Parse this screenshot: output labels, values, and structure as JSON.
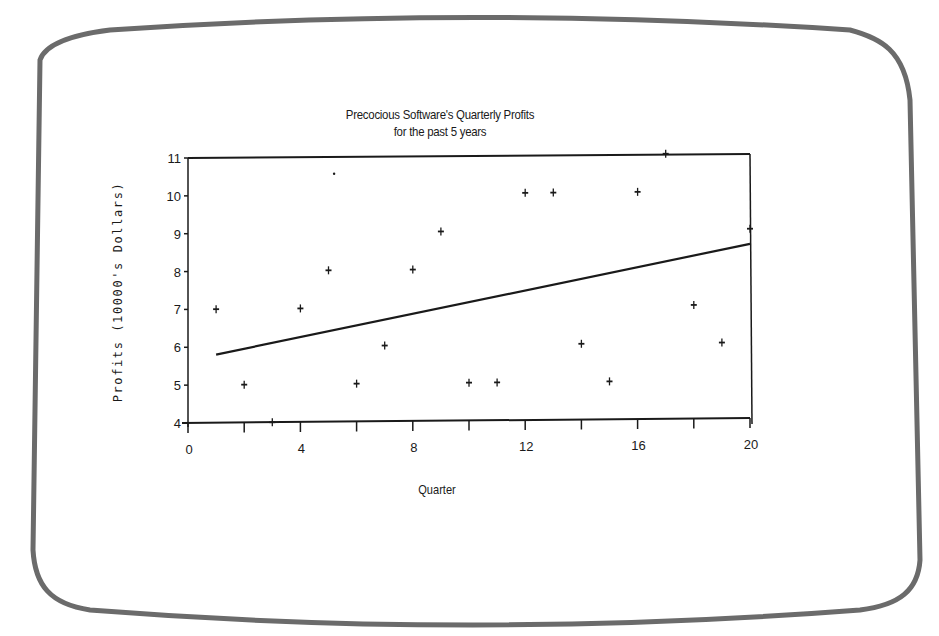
{
  "chart_data": {
    "type": "scatter",
    "title": "Precocious Software's Quarterly Profits",
    "subtitle": "for the past 5 years",
    "xlabel": "Quarter",
    "ylabel": "Profits (10000's Dollars)",
    "xlim": [
      0,
      20
    ],
    "ylim": [
      4,
      11
    ],
    "x_ticks": [
      0,
      2,
      4,
      6,
      8,
      10,
      12,
      14,
      16,
      18,
      20
    ],
    "x_tick_labels": [
      "0",
      "4",
      "8",
      "12",
      "16",
      "20"
    ],
    "x_tick_label_values": [
      0,
      4,
      8,
      12,
      16,
      20
    ],
    "y_ticks": [
      4,
      5,
      6,
      7,
      8,
      9,
      10,
      11
    ],
    "y_tick_labels": [
      "4",
      "5",
      "6",
      "7",
      "8",
      "9",
      "10",
      "11"
    ],
    "grid": false,
    "legend": null,
    "series": [
      {
        "name": "Quarterly Profits",
        "marker": "+",
        "x": [
          1,
          2,
          3,
          4,
          5,
          6,
          7,
          8,
          9,
          10,
          11,
          12,
          13,
          14,
          15,
          16,
          17,
          18,
          19,
          20
        ],
        "y": [
          7,
          5,
          4,
          7,
          8,
          5,
          6,
          8,
          9,
          5,
          5,
          10,
          10,
          6,
          5,
          10,
          11,
          7,
          6,
          9
        ]
      },
      {
        "name": "Linear trend",
        "type": "line",
        "x": [
          1,
          20
        ],
        "y": [
          5.8,
          8.6
        ]
      }
    ],
    "annotations": [
      {
        "type": "stray-dot",
        "x": 5.2,
        "y": 10.55
      }
    ]
  },
  "frame": {
    "bezel_color": "#6b6b6b",
    "ink_color": "#1a1a1a",
    "background": "#ffffff"
  }
}
